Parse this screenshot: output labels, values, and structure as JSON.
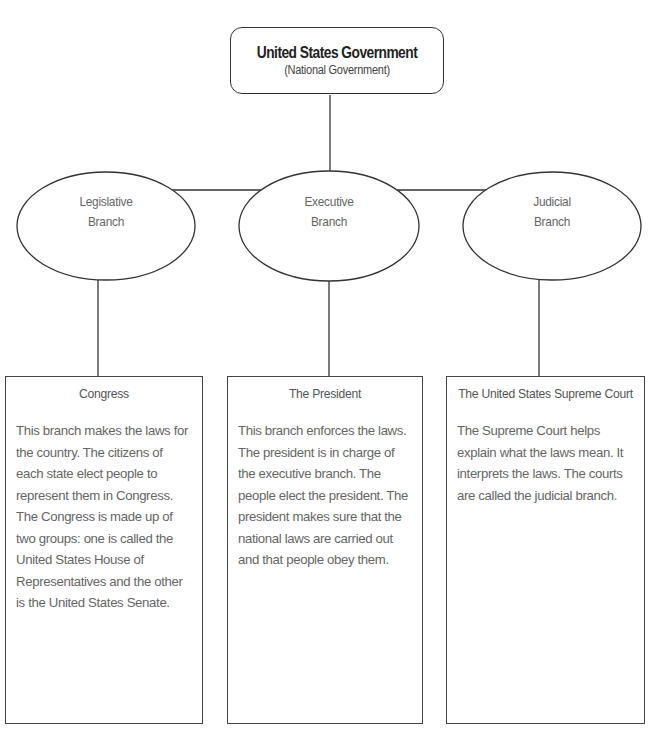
{
  "diagram": {
    "root": {
      "title": "United States Government",
      "subtitle": "(National Government)"
    },
    "branches": [
      {
        "name_line1": "Legislative",
        "name_line2": "Branch",
        "card_title": "Congress",
        "card_body": "This branch makes the laws for the country. The citizens of each state elect people to represent them in Congress. The Congress is made up of two groups: one is called the United States House of Representatives and the other is the United States Senate."
      },
      {
        "name_line1": "Executive",
        "name_line2": "Branch",
        "card_title": "The President",
        "card_body": "This branch enforces the laws. The president is in charge of the executive branch. The people elect the president. The president makes sure that the national laws are carried out and that people obey them."
      },
      {
        "name_line1": "Judicial",
        "name_line2": "Branch",
        "card_title": "The United States Supreme Court",
        "card_body": "The Supreme Court helps explain what the laws mean. It interprets the laws. The courts are called the judicial branch."
      }
    ],
    "colors": {
      "stroke": "#333333",
      "text": "#666666"
    }
  }
}
